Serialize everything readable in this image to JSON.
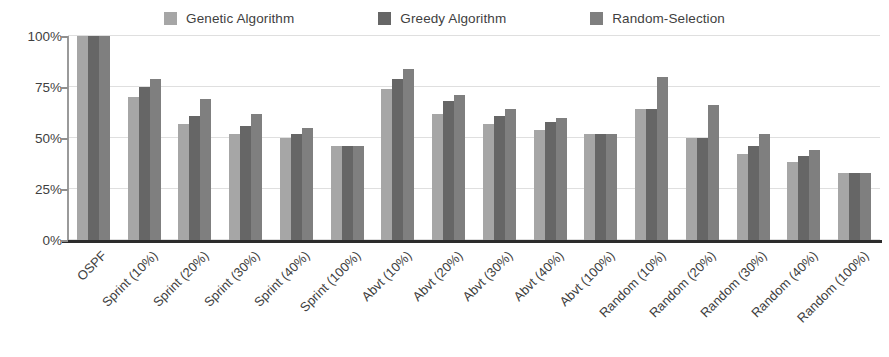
{
  "chart_data": {
    "type": "bar",
    "title": "",
    "subtitle": "",
    "xlabel": "",
    "ylabel": "",
    "ylim": [
      0,
      100
    ],
    "y_ticks": [
      0,
      25,
      50,
      75,
      100
    ],
    "y_tick_labels": [
      "0%",
      "25%",
      "50%",
      "75%",
      "100%"
    ],
    "grid": true,
    "legend_position": "top-center",
    "value_unit": "%",
    "categories": [
      "OSPF",
      "Sprint (10%)",
      "Sprint (20%)",
      "Sprint (30%)",
      "Sprint (40%)",
      "Sprint (100%)",
      "Abvt (10%)",
      "Abvt (20%)",
      "Abvt (30%)",
      "Abvt (40%)",
      "Abvt (100%)",
      "Random (10%)",
      "Random (20%)",
      "Random (30%)",
      "Random (40%)",
      "Random (100%)"
    ],
    "series": [
      {
        "name": "Genetic Algorithm",
        "color": "#a6a6a6",
        "values": [
          100,
          70,
          57,
          52,
          50,
          46,
          74,
          62,
          57,
          54,
          52,
          64,
          50,
          42,
          38,
          33
        ]
      },
      {
        "name": "Greedy Algorithm",
        "color": "#666666",
        "values": [
          100,
          75,
          61,
          56,
          52,
          46,
          79,
          68,
          61,
          58,
          52,
          64,
          50,
          46,
          41,
          33
        ]
      },
      {
        "name": "Random-Selection",
        "color": "#7f7f7f",
        "values": [
          100,
          79,
          69,
          62,
          55,
          46,
          84,
          71,
          64,
          60,
          52,
          80,
          66,
          52,
          44,
          33
        ]
      }
    ]
  },
  "style": {
    "background": "#ffffff",
    "axis_color": "#2c2c2c",
    "grid_color": "#dfdfdf",
    "text_color": "#3f3f3f"
  }
}
